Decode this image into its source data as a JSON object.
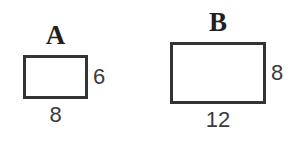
{
  "figure": {
    "background_color": "#ffffff",
    "stroke_color": "#333333",
    "label_color": "#231f20",
    "dimension_color": "#3b3b3b"
  },
  "shapes": [
    {
      "id": "a",
      "label": "A",
      "type": "rectangle",
      "width_label": "8",
      "height_label": "6",
      "width_px": 65,
      "height_px": 44,
      "border_width_px": 3
    },
    {
      "id": "b",
      "label": "B",
      "type": "rectangle",
      "width_label": "12",
      "height_label": "8",
      "width_px": 96,
      "height_px": 62,
      "border_width_px": 3
    }
  ]
}
